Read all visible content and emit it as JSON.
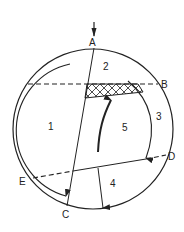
{
  "diagram": {
    "points": {
      "A": "A",
      "B": "B",
      "C": "C",
      "D": "D",
      "E": "E"
    },
    "regions": {
      "r1": "1",
      "r2": "2",
      "r3": "3",
      "r4": "4",
      "r5": "5"
    },
    "colors": {
      "stroke": "#222222",
      "background": "#ffffff"
    }
  }
}
